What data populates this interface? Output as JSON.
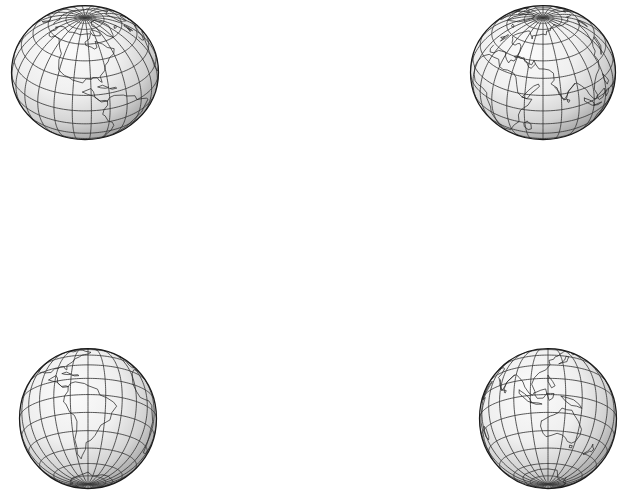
{
  "figure": {
    "background_color": "#ffffff",
    "width": 619,
    "height": 493,
    "line_color": "#2b2b2b",
    "graticule_color": "#3a3a3a",
    "band_light_color": "#ececec",
    "band_pale_color": "#fafafa",
    "globe_light_color": "#f4f4f4",
    "globe_shadow_color": "#7d7d7d"
  },
  "projection": {
    "name": "interrupted-homolosine",
    "label": "Interrupted Homolosine",
    "lobe_count": 4,
    "graticule_interval_deg": 15,
    "parallel_interval_deg": 15,
    "latitude_range": [
      -90,
      90
    ],
    "longitude_range": [
      -180,
      180
    ],
    "bounds": {
      "x": 95,
      "y": 131,
      "width": 463,
      "height": 191
    },
    "lobes": [
      {
        "name": "lobe-pacific-north-america",
        "central_meridian": -160,
        "lon_from": -180,
        "lon_to": -100,
        "hemisphere": "north"
      },
      {
        "name": "lobe-americas",
        "central_meridian": -60,
        "lon_from": -100,
        "lon_to": -20,
        "hemisphere": "both"
      },
      {
        "name": "lobe-europe-africa",
        "central_meridian": 20,
        "lon_from": -20,
        "lon_to": 80,
        "hemisphere": "both"
      },
      {
        "name": "lobe-asia-australia",
        "central_meridian": 120,
        "lon_from": 80,
        "lon_to": 180,
        "hemisphere": "both"
      }
    ]
  },
  "globes": [
    {
      "id": "globe-top-left",
      "position": "top-left",
      "center_lat": 35,
      "center_lon": -95,
      "label": "North America / Arctic view",
      "landmasses": [
        "North America",
        "Greenland",
        "Central America",
        "Arctic"
      ],
      "bounds": {
        "x": 10,
        "y": 4,
        "width": 150,
        "height": 137
      }
    },
    {
      "id": "globe-top-right",
      "position": "top-right",
      "center_lat": 35,
      "center_lon": 60,
      "label": "Eurasia / Africa view",
      "landmasses": [
        "Europe",
        "Asia",
        "Africa",
        "Arabia",
        "India",
        "Arctic"
      ],
      "bounds": {
        "x": 469,
        "y": 4,
        "width": 148,
        "height": 137
      }
    },
    {
      "id": "globe-bottom-left",
      "position": "bottom-left",
      "center_lat": -20,
      "center_lon": -60,
      "label": "South America view",
      "landmasses": [
        "South America",
        "Central America",
        "Africa (west edge)",
        "Antarctica"
      ],
      "bounds": {
        "x": 18,
        "y": 347,
        "width": 140,
        "height": 143
      }
    },
    {
      "id": "globe-bottom-right",
      "position": "bottom-right",
      "center_lat": -20,
      "center_lon": 120,
      "label": "Australia / Southeast Asia view",
      "landmasses": [
        "Australia",
        "Southeast Asia",
        "Indonesia",
        "New Guinea",
        "New Zealand",
        "Antarctica"
      ],
      "bounds": {
        "x": 478,
        "y": 347,
        "width": 140,
        "height": 143
      }
    }
  ],
  "chart_data": {
    "type": "map",
    "map_projection": "interrupted homolosine (Goode-style)",
    "graticule_spacing_degrees": 15,
    "interruption_meridians": [
      -100,
      -20,
      80
    ],
    "globe_projection": "orthographic",
    "globe_views": [
      {
        "view": "top-left",
        "center": [
          35,
          -95
        ]
      },
      {
        "view": "top-right",
        "center": [
          35,
          60
        ]
      },
      {
        "view": "bottom-left",
        "center": [
          -20,
          -60
        ]
      },
      {
        "view": "bottom-right",
        "center": [
          -20,
          120
        ]
      }
    ],
    "xlabel": "longitude",
    "ylabel": "latitude",
    "xlim": [
      -180,
      180
    ],
    "ylim": [
      -90,
      90
    ],
    "grid": true,
    "legend": "none"
  }
}
